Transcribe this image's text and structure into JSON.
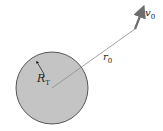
{
  "diagram": {
    "planet": {
      "label": "R",
      "label_sub": "T",
      "fill": "#c4c4c4",
      "stroke": "#333333"
    },
    "radius_vector": {
      "label": "r",
      "label_sub": "0",
      "color": "#8a8a8a"
    },
    "velocity": {
      "label": "v",
      "label_sub": "0",
      "color": "#6e6e6e"
    }
  }
}
